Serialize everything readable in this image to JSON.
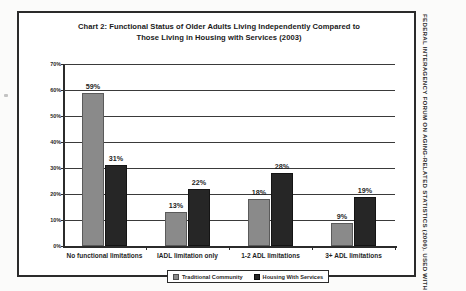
{
  "credit": "FEDERAL INTERAGENCY FORUM ON AGING-RELATED STATISTICS (2006). USED WITH PERMISSION.",
  "chart_data": {
    "type": "bar",
    "title_line1": "Chart 2:  Functional Status of Older Adults Living Independently Compared to",
    "title_line2": "Those Living in Housing with Services (2003)",
    "title": "Chart 2: Functional Status of Older Adults Living Independently Compared to Those Living in Housing with Services (2003)",
    "xlabel": "",
    "ylabel": "",
    "ylim": [
      0,
      70
    ],
    "ytick_step": 10,
    "ytick_labels": [
      "70%",
      "60%",
      "50%",
      "40%",
      "30%",
      "20%",
      "10%",
      "0%"
    ],
    "ytick_values": [
      70,
      60,
      50,
      40,
      30,
      20,
      10,
      0
    ],
    "grid": true,
    "legend_position": "bottom",
    "categories": [
      "No functional limitations",
      "IADL limitation only",
      "1-2 ADL limitations",
      "3+ ADL limitations"
    ],
    "series": [
      {
        "name": "Traditional Community",
        "color": "#8a8a8a",
        "values": [
          59,
          13,
          18,
          9
        ],
        "labels": [
          "59%",
          "13%",
          "18%",
          "9%"
        ]
      },
      {
        "name": "Housing With Services",
        "color": "#262626",
        "values": [
          31,
          22,
          28,
          19
        ],
        "labels": [
          "31%",
          "22%",
          "28%",
          "19%"
        ]
      }
    ]
  }
}
